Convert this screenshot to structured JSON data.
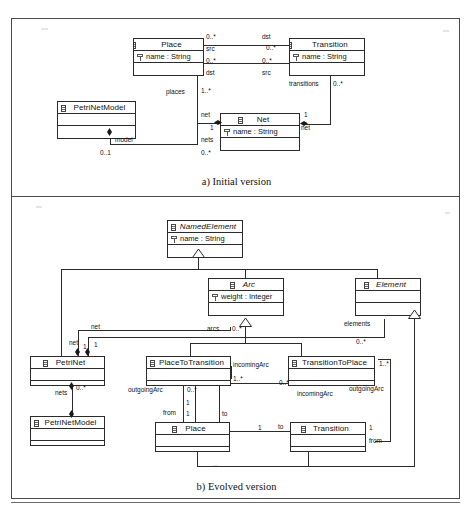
{
  "figure": {
    "caption_a": "a) Initial version",
    "caption_b": "b) Evolved version"
  },
  "panel_a": {
    "classes": [
      {
        "id": "a-place",
        "name": "Place",
        "abstract": false,
        "attributes": [
          "name : String"
        ],
        "empty_rows": 1
      },
      {
        "id": "a-transition",
        "name": "Transition",
        "abstract": false,
        "attributes": [
          "name : String"
        ],
        "empty_rows": 1
      },
      {
        "id": "a-petrinetmodel",
        "name": "PetriNetModel",
        "abstract": false,
        "attributes": [],
        "empty_rows": 2
      },
      {
        "id": "a-net",
        "name": "Net",
        "abstract": false,
        "attributes": [
          "name : String"
        ],
        "empty_rows": 1
      }
    ],
    "labels": {
      "dst_top_right": "dst",
      "mult_top_left": "0..*",
      "mult_top_right": "0..*",
      "src_left": "src",
      "src_bottom_right": "src",
      "mult_mid_left": "0..*",
      "mult_mid_right": "0..*",
      "dst_bottom_left": "dst",
      "places": "places",
      "places_mult": "1..*",
      "transitions": "transitions",
      "transitions_mult": "0..*",
      "net_left": "net",
      "net_left_mult": "1",
      "net_right_mult": "1",
      "net_right": "net",
      "nets": "nets",
      "nets_mult": "0..*",
      "model": "model",
      "model_mult": "0..1"
    }
  },
  "panel_b": {
    "classes": [
      {
        "id": "b-namedelement",
        "name": "NamedElement",
        "abstract": true,
        "attributes": [
          "name : String"
        ],
        "empty_rows": 1
      },
      {
        "id": "b-arc",
        "name": "Arc",
        "abstract": true,
        "attributes": [
          "weight : Integer"
        ],
        "empty_rows": 1
      },
      {
        "id": "b-element",
        "name": "Element",
        "abstract": true,
        "attributes": [],
        "empty_rows": 2
      },
      {
        "id": "b-petrinet",
        "name": "PetriNet",
        "abstract": false,
        "attributes": [],
        "empty_rows": 2
      },
      {
        "id": "b-placetotransition",
        "name": "PlaceToTransition",
        "abstract": false,
        "attributes": [],
        "empty_rows": 2
      },
      {
        "id": "b-transitiontoplace",
        "name": "TransitionToPlace",
        "abstract": false,
        "attributes": [],
        "empty_rows": 2
      },
      {
        "id": "b-petrinetmodel",
        "name": "PetriNetModel",
        "abstract": false,
        "attributes": [],
        "empty_rows": 2
      },
      {
        "id": "b-place",
        "name": "Place",
        "abstract": false,
        "attributes": [],
        "empty_rows": 2
      },
      {
        "id": "b-transition",
        "name": "Transition",
        "abstract": false,
        "attributes": [],
        "empty_rows": 2
      }
    ],
    "labels": {
      "net_upper": "net",
      "net_lower": "net",
      "net_mult_1a": "1",
      "net_mult_1b": "1",
      "arcs": "arcs",
      "arcs_mult": "0..*",
      "elements": "elements",
      "elements_mult": "0..*",
      "nets": "nets",
      "nets_mult": "0..*",
      "incoming_arc_left": "incomingArc",
      "incoming_arc_left_mult": "1..*",
      "outgoing_arc_left": "outgoingArc",
      "outgoing_arc_left_mult": "0..*",
      "incoming_arc_right": "incomingArc",
      "incoming_arc_right_mult": "0..*",
      "outgoing_arc_right": "outgoingArc",
      "outgoing_arc_right_mult": "1..*",
      "from_left": "from",
      "from_left_mult": "1",
      "to_left": "to",
      "to_left_mult": "1",
      "to_right": "to",
      "to_right_mult": "1",
      "from_right": "from",
      "from_right_mult": "1"
    }
  }
}
